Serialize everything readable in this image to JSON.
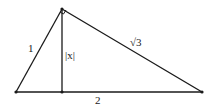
{
  "diagram": {
    "type": "right-triangle-with-altitude",
    "stroke_color": "#1a1a1a",
    "vertices": {
      "left": [
        16,
        92
      ],
      "apex": [
        62,
        9
      ],
      "right": [
        202,
        92
      ],
      "foot": [
        62,
        92
      ]
    },
    "labels": {
      "left_side": "1",
      "altitude": "|x|",
      "right_side": "√3",
      "base": "2"
    },
    "right_angle_marker": "apex"
  }
}
